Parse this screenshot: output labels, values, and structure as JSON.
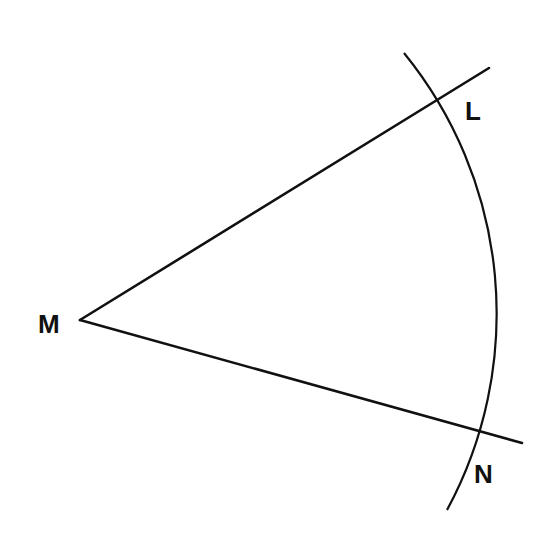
{
  "diagram": {
    "type": "geometry-construction",
    "points": {
      "M": {
        "label": "M",
        "x": 80,
        "y": 320
      },
      "L": {
        "label": "L",
        "x": 436,
        "y": 101
      },
      "N": {
        "label": "N",
        "x": 477,
        "y": 430
      }
    },
    "rays": [
      {
        "name": "ML",
        "from": "M",
        "to": [
          489,
          68
        ]
      },
      {
        "name": "MN",
        "from": "M",
        "to": [
          522,
          443
        ]
      }
    ],
    "arc": {
      "center": "M",
      "radius": 413,
      "start": [
        404,
        53
      ],
      "end": [
        447,
        510
      ]
    },
    "colors": {
      "stroke": "#111111",
      "background": "#ffffff"
    }
  }
}
